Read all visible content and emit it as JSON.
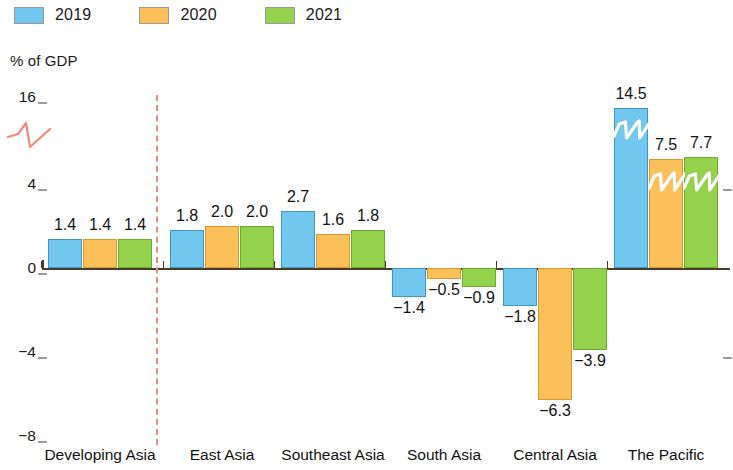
{
  "legend": {
    "items": [
      {
        "label": "2019",
        "color": "#72c7ee",
        "key": "c2019"
      },
      {
        "label": "2020",
        "color": "#fcc05a",
        "key": "c2020"
      },
      {
        "label": "2021",
        "color": "#94d24e",
        "key": "c2021"
      }
    ]
  },
  "axis": {
    "y_title": "% of GDP",
    "y_ticks": [
      "16",
      "4",
      "0",
      "−4",
      "−8"
    ]
  },
  "annotations": {
    "divider": "red-dashed-divider",
    "axis_break": "broken-axis-zigzag"
  },
  "chart_data": {
    "type": "bar",
    "title": "",
    "subtitle": "",
    "xlabel": "",
    "ylabel": "% of GDP",
    "ylim": [
      -8,
      16
    ],
    "yticks": [
      -8,
      -4,
      0,
      4,
      16
    ],
    "broken_axis": true,
    "broken_axis_range": [
      4,
      16
    ],
    "grid": false,
    "legend_position": "top-left",
    "categories": [
      "Developing Asia",
      "East Asia",
      "Southeast Asia",
      "South Asia",
      "Central Asia",
      "The Pacific"
    ],
    "series": [
      {
        "name": "2019",
        "color": "#72c7ee",
        "values": [
          1.4,
          1.8,
          2.7,
          -1.4,
          -1.8,
          14.5
        ]
      },
      {
        "name": "2020",
        "color": "#fcc05a",
        "values": [
          1.4,
          2.0,
          1.6,
          -0.5,
          -6.3,
          7.5
        ]
      },
      {
        "name": "2021",
        "color": "#94d24e",
        "values": [
          1.4,
          2.0,
          1.8,
          -0.9,
          -3.9,
          7.7
        ]
      }
    ],
    "data_labels": {
      "Developing Asia": [
        "1.4",
        "1.4",
        "1.4"
      ],
      "East Asia": [
        "1.8",
        "2.0",
        "2.0"
      ],
      "Southeast Asia": [
        "2.7",
        "1.6",
        "1.8"
      ],
      "South Asia": [
        "−1.4",
        "−0.5",
        "−0.9"
      ],
      "Central Asia": [
        "−1.8",
        "−6.3",
        "−3.9"
      ],
      "The Pacific": [
        "14.5",
        "7.5",
        "7.7"
      ]
    }
  }
}
